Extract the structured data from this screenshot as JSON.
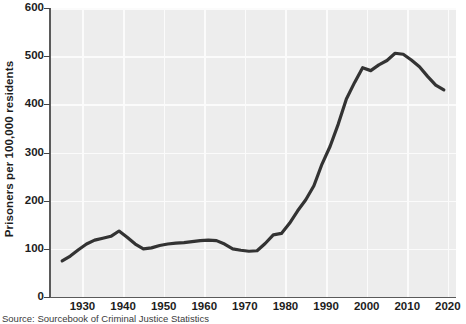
{
  "chart_data": {
    "type": "line",
    "title": "",
    "xlabel": "",
    "ylabel": "Prisoners per 100,000 residents",
    "xlim": [
      1922,
      2022
    ],
    "ylim": [
      0,
      600
    ],
    "grid": true,
    "legend": null,
    "xticks": [
      "1930",
      "1940",
      "1950",
      "1960",
      "1970",
      "1980",
      "1990",
      "2000",
      "2010",
      "2020"
    ],
    "yticks": [
      "0",
      "100",
      "200",
      "300",
      "400",
      "500",
      "600"
    ],
    "line_color": "#333333",
    "plot_background": "#ededed",
    "gridline_color": "#fbfbfb",
    "series": [
      {
        "name": "Prisoners per 100,000 residents",
        "x": [
          1925,
          1927,
          1929,
          1931,
          1933,
          1935,
          1937,
          1939,
          1941,
          1943,
          1945,
          1947,
          1949,
          1951,
          1953,
          1955,
          1957,
          1959,
          1961,
          1963,
          1965,
          1967,
          1969,
          1971,
          1973,
          1975,
          1977,
          1979,
          1981,
          1983,
          1985,
          1987,
          1989,
          1991,
          1993,
          1995,
          1997,
          1999,
          2001,
          2003,
          2005,
          2007,
          2009,
          2011,
          2013,
          2015,
          2017,
          2019
        ],
        "values": [
          75,
          85,
          98,
          110,
          118,
          122,
          126,
          137,
          124,
          110,
          100,
          102,
          107,
          110,
          112,
          113,
          115,
          117,
          118,
          117,
          110,
          100,
          97,
          95,
          96,
          111,
          129,
          132,
          153,
          179,
          202,
          231,
          276,
          313,
          359,
          411,
          445,
          476,
          470,
          482,
          491,
          506,
          504,
          492,
          478,
          458,
          440,
          430
        ]
      }
    ],
    "annotations": []
  },
  "source": {
    "text": "Source: Sourcebook of Criminal Justice Statistics"
  }
}
